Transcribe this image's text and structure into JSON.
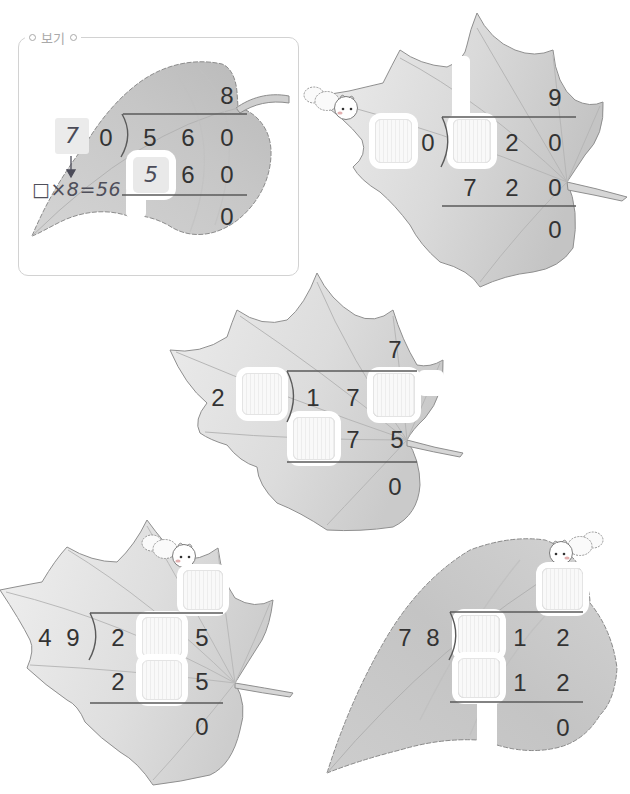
{
  "colors": {
    "background": "#ffffff",
    "digit": "#333333",
    "handwriting": "#4b4b58",
    "rule_line": "#5a5a5a",
    "leaf_fill": "#cfcfcf",
    "leaf_outline": "#8c8c8c",
    "blank_fill": "#f3f3f3",
    "frame_border": "#d2d2d2",
    "label_text": "#a9a9a9"
  },
  "example": {
    "label": "보기",
    "quotient": "8",
    "divisor": [
      "7",
      "0"
    ],
    "dividend": [
      "5",
      "6",
      "0"
    ],
    "product": [
      "5",
      "6",
      "0"
    ],
    "remainder": "0",
    "hint": "□×8=56",
    "handwritten_cells": [
      "divisor.0",
      "product.0"
    ]
  },
  "problems": [
    {
      "quotient": "9",
      "divisor": [
        "",
        "0"
      ],
      "dividend": [
        "",
        "2",
        "0"
      ],
      "product": [
        "7",
        "2",
        "0"
      ],
      "remainder": "0"
    },
    {
      "quotient": "7",
      "divisor": [
        "2",
        ""
      ],
      "dividend": [
        "1",
        "7",
        ""
      ],
      "product": [
        "",
        "7",
        "5"
      ],
      "remainder": "0"
    },
    {
      "quotient": "",
      "divisor": [
        "4",
        "9"
      ],
      "dividend": [
        "2",
        "",
        "5"
      ],
      "product": [
        "2",
        "",
        "5"
      ],
      "remainder": "0"
    },
    {
      "quotient": "",
      "divisor": [
        "7",
        "8"
      ],
      "dividend": [
        "",
        "1",
        "2"
      ],
      "product": [
        "",
        "1",
        "2"
      ],
      "remainder": "0"
    }
  ],
  "icons": {
    "caterpillar": "caterpillar-icon",
    "arrow": "arrow-down-icon",
    "bullet": "circle-bullet-icon"
  }
}
